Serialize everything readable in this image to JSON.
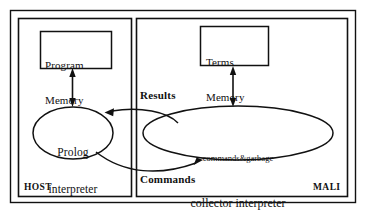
{
  "diagram": {
    "zones": [
      {
        "id": "host",
        "label": "HOST"
      },
      {
        "id": "mali",
        "label": "MALI"
      }
    ],
    "boxes": [
      {
        "id": "program-memory",
        "line1": "Program",
        "line2": "Memory"
      },
      {
        "id": "terms-memory",
        "line1": "Terms",
        "line2": "Memory"
      }
    ],
    "ellipses": [
      {
        "id": "prolog-interpreter",
        "line1": "Prolog",
        "line2": "interpreter"
      },
      {
        "id": "collector-interpreter",
        "line1": "commands&garbage",
        "line2": "collector interpreter"
      }
    ],
    "arrow_labels": [
      {
        "id": "results",
        "label": "Results"
      },
      {
        "id": "commands",
        "label": "Commands"
      }
    ],
    "colors": {
      "stroke": "#111111",
      "background": "#ffffff",
      "text": "#111111"
    }
  }
}
